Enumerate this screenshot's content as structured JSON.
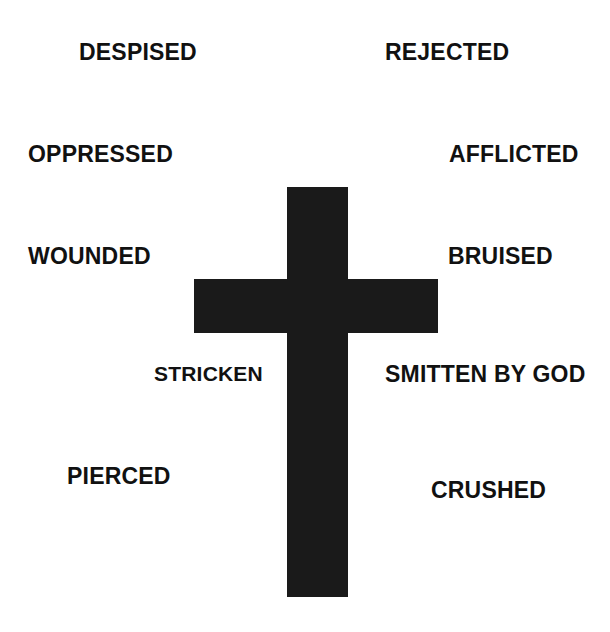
{
  "diagram": {
    "background_color": "#ffffff",
    "shape": {
      "name": "latin-cross",
      "color": "#1a1a1a",
      "vertical_bar": {
        "x": 287,
        "y": 187,
        "width": 61,
        "height": 410
      },
      "horizontal_bar": {
        "x": 194,
        "y": 279,
        "width": 244,
        "height": 54
      }
    },
    "labels": [
      {
        "id": "despised",
        "text": "DESPISED",
        "x": 79,
        "y": 41,
        "side": "left"
      },
      {
        "id": "rejected",
        "text": "REJECTED",
        "x": 385,
        "y": 41,
        "side": "right"
      },
      {
        "id": "oppressed",
        "text": "OPPRESSED",
        "x": 28,
        "y": 143,
        "side": "left"
      },
      {
        "id": "afflicted",
        "text": "AFFLICTED",
        "x": 449,
        "y": 143,
        "side": "right"
      },
      {
        "id": "wounded",
        "text": "WOUNDED",
        "x": 28,
        "y": 245,
        "side": "left"
      },
      {
        "id": "bruised",
        "text": "BRUISED",
        "x": 448,
        "y": 245,
        "side": "right"
      },
      {
        "id": "stricken",
        "text": "STRICKEN",
        "x": 154,
        "y": 363,
        "side": "left"
      },
      {
        "id": "smitten",
        "text": "SMITTEN BY GOD",
        "x": 385,
        "y": 363,
        "side": "right"
      },
      {
        "id": "pierced",
        "text": "PIERCED",
        "x": 67,
        "y": 465,
        "side": "left"
      },
      {
        "id": "crushed",
        "text": "CRUSHED",
        "x": 431,
        "y": 479,
        "side": "right"
      }
    ]
  }
}
